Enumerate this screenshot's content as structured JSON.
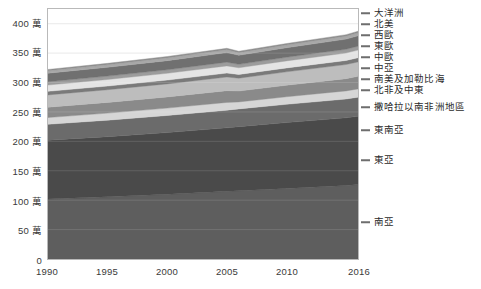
{
  "chart_data": {
    "type": "area",
    "title": "",
    "subtitle": "",
    "xlabel": "",
    "ylabel": "",
    "stacked": true,
    "grid": true,
    "legend_position": "right",
    "xlim": [
      1990,
      2016
    ],
    "ylim": [
      0,
      4250000
    ],
    "x": [
      1990,
      1995,
      2000,
      2005,
      2006,
      2010,
      2015,
      2016
    ],
    "x_tick_labels": [
      "1990",
      "1995",
      "2000",
      "2005",
      "2010",
      "2016"
    ],
    "x_ticks": [
      1990,
      1995,
      2000,
      2005,
      2010,
      2016
    ],
    "y_ticks": [
      0,
      500000,
      1000000,
      1500000,
      2000000,
      2500000,
      3000000,
      3500000,
      4000000
    ],
    "y_tick_labels": [
      "0",
      "50 萬",
      "100 萬",
      "150 萬",
      "200 萬",
      "250 萬",
      "300 萬",
      "350 萬",
      "400 萬"
    ],
    "series": [
      {
        "name": "南亞",
        "color": "#5e5e5e",
        "values": [
          1020000,
          1060000,
          1100000,
          1150000,
          1160000,
          1200000,
          1250000,
          1265000
        ]
      },
      {
        "name": "東亞",
        "color": "#4a4a4a",
        "values": [
          1000000,
          1020000,
          1050000,
          1080000,
          1090000,
          1120000,
          1150000,
          1160000
        ]
      },
      {
        "name": "東南亞",
        "color": "#6b6b6b",
        "values": [
          270000,
          280000,
          290000,
          300000,
          302000,
          310000,
          320000,
          325000
        ]
      },
      {
        "name": "撒哈拉以南非洲地區",
        "color": "#d6d6d6",
        "values": [
          115000,
          120000,
          125000,
          132000,
          118000,
          128000,
          138000,
          142000
        ]
      },
      {
        "name": "北非及中東",
        "color": "#8a8a8a",
        "values": [
          175000,
          182000,
          190000,
          200000,
          186000,
          196000,
          208000,
          213000
        ]
      },
      {
        "name": "南美及加勒比海",
        "color": "#bdbdbd",
        "values": [
          210000,
          216000,
          222000,
          232000,
          218000,
          228000,
          240000,
          246000
        ]
      },
      {
        "name": "中亞",
        "color": "#7a7a7a",
        "values": [
          60000,
          62000,
          64000,
          67000,
          63000,
          66000,
          69000,
          71000
        ]
      },
      {
        "name": "中歐",
        "color": "#e4e4e4",
        "values": [
          108000,
          112000,
          116000,
          122000,
          114000,
          120000,
          127000,
          130000
        ]
      },
      {
        "name": "東歐",
        "color": "#9c9c9c",
        "values": [
          55000,
          57000,
          59000,
          62000,
          58000,
          61000,
          64000,
          66000
        ]
      },
      {
        "name": "西歐",
        "color": "#707070",
        "values": [
          145000,
          150000,
          156000,
          164000,
          154000,
          162000,
          172000,
          176000
        ]
      },
      {
        "name": "北美",
        "color": "#a8a8a8",
        "values": [
          42000,
          44000,
          46000,
          48000,
          45000,
          47000,
          50000,
          51000
        ]
      },
      {
        "name": "大洋洲",
        "color": "#8f8f8f",
        "values": [
          22000,
          23000,
          24000,
          25000,
          24000,
          25000,
          26000,
          27000
        ]
      }
    ],
    "totals": [
      3222000,
      3326000,
      3442000,
      3582000,
      3532000,
      3663000,
      3814000,
      3872000
    ],
    "legend_entries": [
      {
        "label": "大洋洲",
        "y": 13
      },
      {
        "label": "北美",
        "y": 24
      },
      {
        "label": "西歐",
        "y": 35
      },
      {
        "label": "東歐",
        "y": 46
      },
      {
        "label": "中歐",
        "y": 57
      },
      {
        "label": "中亞",
        "y": 68
      },
      {
        "label": "南美及加勒比海",
        "y": 79
      },
      {
        "label": "北非及中東",
        "y": 90
      },
      {
        "label": "撒哈拉以南非洲地區",
        "y": 107
      },
      {
        "label": "東南亞",
        "y": 130
      },
      {
        "label": "東亞",
        "y": 160
      },
      {
        "label": "南亞",
        "y": 222
      }
    ]
  }
}
